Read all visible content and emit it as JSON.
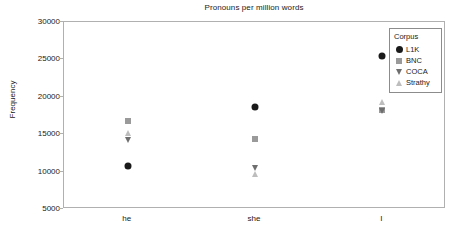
{
  "chart_data": {
    "type": "scatter",
    "title": "Pronouns per million words",
    "xlabel": "",
    "ylabel": "Frequency",
    "categories": [
      "he",
      "she",
      "I"
    ],
    "ylim": [
      5000,
      30000
    ],
    "yticks": [
      5000,
      10000,
      15000,
      20000,
      25000,
      30000
    ],
    "ytick_labels": [
      "5000",
      "10000",
      "15000",
      "20000",
      "25000",
      "30000"
    ],
    "grid": false,
    "legend_position": "top-right",
    "legend_title": "Corpus",
    "series": [
      {
        "name": "L1K",
        "marker": "circle",
        "color": "#1a1a1a",
        "values": [
          10700,
          18650,
          25400
        ]
      },
      {
        "name": "BNC",
        "marker": "square",
        "color": "#9a9a9a",
        "values": [
          16700,
          14300,
          18300
        ]
      },
      {
        "name": "COCA",
        "marker": "triangle-down",
        "color": "#6e6e6e",
        "values": [
          14200,
          10500,
          18100
        ]
      },
      {
        "name": "Strathy",
        "marker": "triangle-up",
        "color": "#bdbdbd",
        "values": [
          15200,
          9700,
          19300
        ]
      }
    ]
  },
  "legend": {
    "title": "Corpus",
    "entries": [
      {
        "label": "L1K",
        "marker": "circle",
        "color": "#1a1a1a"
      },
      {
        "label": "BNC",
        "marker": "square",
        "color": "#9a9a9a"
      },
      {
        "label": "COCA",
        "marker": "triangle-down",
        "color": "#6e6e6e"
      },
      {
        "label": "Strathy",
        "marker": "triangle-up",
        "color": "#bdbdbd"
      }
    ]
  },
  "axes": {
    "frame_color": "#b0b0b0"
  }
}
